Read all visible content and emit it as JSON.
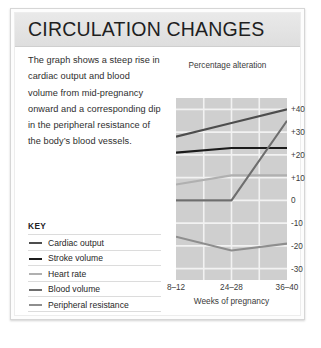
{
  "page": {
    "title": "CIRCULATION CHANGES",
    "body_text": "The graph shows a steep rise in cardiac output and blood volume from mid-pregnancy onward and a corresponding dip in the peripheral resistance of the body’s blood vessels."
  },
  "key": {
    "heading": "KEY",
    "items": [
      {
        "label": "Cardiac output",
        "color": "#4d4d4d"
      },
      {
        "label": "Stroke volume",
        "color": "#1c1c1c"
      },
      {
        "label": "Heart rate",
        "color": "#b0b0b0"
      },
      {
        "label": "Blood volume",
        "color": "#6e6e6e"
      },
      {
        "label": "Peripheral resistance",
        "color": "#8e8e8e"
      }
    ]
  },
  "chart_data": {
    "type": "line",
    "title": "",
    "ylabel": "Percentage alteration",
    "xlabel": "Weeks of pregnancy",
    "categories": [
      "8–12",
      "24–28",
      "36–40"
    ],
    "x": [
      0,
      1,
      2
    ],
    "ylim": [
      -35,
      45
    ],
    "yticks": [
      40,
      30,
      20,
      10,
      0,
      -10,
      -20,
      -30
    ],
    "ytick_labels": [
      "+40",
      "+30",
      "+20",
      "+10",
      "0",
      "-10",
      "-20",
      "-30"
    ],
    "grid": true,
    "legend_position": "left-panel",
    "plot_background": "#cfcfcf",
    "gridline_color": "#f2f2f2",
    "series": [
      {
        "name": "Cardiac output",
        "color": "#4d4d4d",
        "values": [
          28,
          34,
          40
        ]
      },
      {
        "name": "Stroke volume",
        "color": "#1c1c1c",
        "values": [
          21,
          23,
          23
        ]
      },
      {
        "name": "Heart rate",
        "color": "#b0b0b0",
        "values": [
          7,
          11,
          11
        ]
      },
      {
        "name": "Blood volume",
        "color": "#6e6e6e",
        "values": [
          0,
          0,
          35
        ]
      },
      {
        "name": "Peripheral resistance",
        "color": "#8e8e8e",
        "values": [
          -16,
          -22,
          -19
        ]
      }
    ]
  }
}
